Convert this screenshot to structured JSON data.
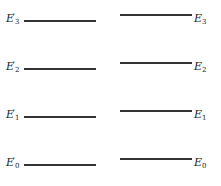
{
  "diagram": {
    "left_levels": [
      {
        "symbol": "E",
        "prime": "'",
        "sub": "3",
        "y": 20
      },
      {
        "symbol": "E",
        "prime": "'",
        "sub": "2",
        "y": 68
      },
      {
        "symbol": "E",
        "prime": "'",
        "sub": "1",
        "y": 116
      },
      {
        "symbol": "E",
        "prime": "'",
        "sub": "0",
        "y": 164
      }
    ],
    "right_levels": [
      {
        "symbol": "E",
        "sub": "3",
        "y": 14
      },
      {
        "symbol": "E",
        "sub": "2",
        "y": 62
      },
      {
        "symbol": "E",
        "sub": "1",
        "y": 110
      },
      {
        "symbol": "E",
        "sub": "0",
        "y": 158
      }
    ],
    "line_color": "#333333"
  }
}
